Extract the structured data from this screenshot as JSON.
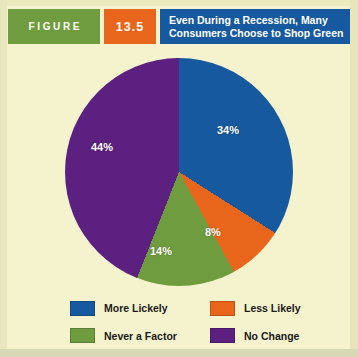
{
  "header": {
    "figure_label": "FIGURE",
    "figure_number": "13.5",
    "title_line1": "Even During a Recession, Many",
    "title_line2": "Consumers Choose to Shop Green"
  },
  "colors": {
    "background": "#f5f3cd",
    "blue": "#17599f",
    "orange": "#e8661b",
    "green": "#6f9c3e",
    "purple": "#5b2080",
    "header_green": "#6f9c3e",
    "header_orange": "#e8661b",
    "header_blue": "#17599f"
  },
  "chart_data": {
    "type": "pie",
    "title": "Even During a Recession, Many Consumers Choose to Shop Green",
    "categories": [
      "More Lickely",
      "Less Likely",
      "Never a Factor",
      "No Change"
    ],
    "values": [
      34,
      8,
      14,
      44
    ],
    "value_labels": [
      "34%",
      "8%",
      "14%",
      "44%"
    ],
    "colors": [
      "#17599f",
      "#e8661b",
      "#6f9c3e",
      "#5b2080"
    ],
    "start_angle_deg": 0,
    "direction": "clockwise",
    "legend_position": "bottom",
    "grid": false,
    "xlabel": "",
    "ylabel": ""
  },
  "legend": {
    "items": [
      {
        "label": "More Lickely",
        "color": "#17599f",
        "value": "34%"
      },
      {
        "label": "Less Likely",
        "color": "#e8661b",
        "value": "8%"
      },
      {
        "label": "Never a Factor",
        "color": "#6f9c3e",
        "value": "14%"
      },
      {
        "label": "No Change",
        "color": "#5b2080",
        "value": "44%"
      }
    ]
  }
}
